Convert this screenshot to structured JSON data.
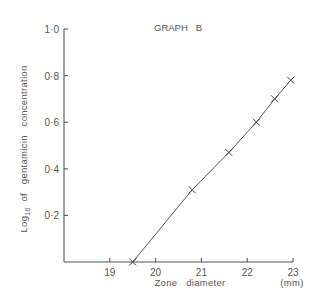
{
  "chart_data": {
    "type": "line",
    "title": "GRAPH   B",
    "xlabel": "Zone   diameter",
    "xlabel_unit": "(mm)",
    "ylabel_main": "Log",
    "ylabel_sub": "10",
    "ylabel_rest": "  of   gentamicin   concentration",
    "xlim": [
      18.0,
      23.0
    ],
    "ylim": [
      0.0,
      1.0
    ],
    "x_ticks": [
      19,
      20,
      21,
      22,
      23
    ],
    "x_tick_labels": [
      "19",
      "20",
      "21",
      "22",
      "23"
    ],
    "y_ticks": [
      0.2,
      0.4,
      0.6,
      0.8,
      1.0
    ],
    "y_tick_labels": [
      "0·2",
      "0·4",
      "0·6",
      "0·8",
      "1·0"
    ],
    "grid": false,
    "marker": "x",
    "series": [
      {
        "name": "Graph B",
        "x": [
          19.5,
          20.8,
          21.6,
          22.2,
          22.6,
          22.95
        ],
        "y": [
          0.0,
          0.31,
          0.47,
          0.6,
          0.7,
          0.78
        ]
      }
    ]
  }
}
